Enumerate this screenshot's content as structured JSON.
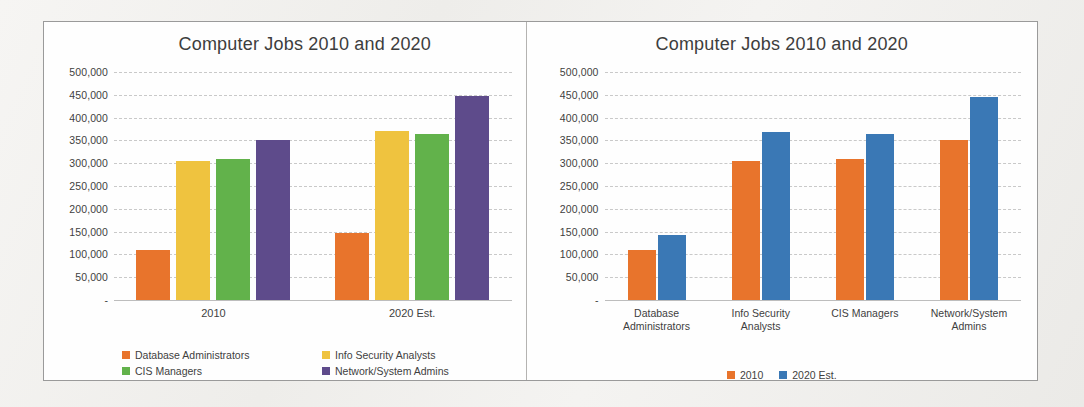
{
  "charts": [
    {
      "id": "left",
      "title": "Computer Jobs 2010 and 2020",
      "legend": [
        {
          "label": "Database Administrators",
          "color": "#E8742C"
        },
        {
          "label": "Info Security Analysts",
          "color": "#EFC githubPLACEHOLDER"
        }
      ]
    }
  ],
  "chart_data": [
    {
      "type": "bar",
      "id": "left-chart",
      "title": "Computer Jobs 2010 and 2020",
      "xlabel": "",
      "ylabel": "",
      "ylim": [
        0,
        500000
      ],
      "ytick_step": 50000,
      "grid": true,
      "legend_position": "bottom",
      "zero_tick_label": "-",
      "categories": [
        "2010",
        "2020 Est."
      ],
      "ytick_labels": [
        "500,000",
        "450,000",
        "400,000",
        "350,000",
        "300,000",
        "250,000",
        "200,000",
        "150,000",
        "100,000",
        "50,000",
        "-"
      ],
      "series": [
        {
          "name": "Database Administrators",
          "color": "#E8742C",
          "values": [
            110000,
            147000
          ]
        },
        {
          "name": "Info Security Analysts",
          "color": "#EFC33F",
          "values": [
            305000,
            370000
          ]
        },
        {
          "name": "CIS Managers",
          "color": "#62B24B",
          "values": [
            310000,
            365000
          ]
        },
        {
          "name": "Network/System Admins",
          "color": "#5E4B8B",
          "values": [
            350000,
            447000
          ]
        }
      ]
    },
    {
      "type": "bar",
      "id": "right-chart",
      "title": "Computer Jobs 2010 and 2020",
      "xlabel": "",
      "ylabel": "",
      "ylim": [
        0,
        500000
      ],
      "ytick_step": 50000,
      "grid": true,
      "legend_position": "bottom",
      "zero_tick_label": "-",
      "categories": [
        "Database Administrators",
        "Info Security Analysts",
        "CIS Managers",
        "Network/System Admins"
      ],
      "category_lines": [
        [
          "Database",
          "Administrators"
        ],
        [
          "Info Security",
          "Analysts"
        ],
        [
          "CIS Managers"
        ],
        [
          "Network/System",
          "Admins"
        ]
      ],
      "ytick_labels": [
        "500,000",
        "450,000",
        "400,000",
        "350,000",
        "300,000",
        "250,000",
        "200,000",
        "150,000",
        "100,000",
        "50,000",
        "-"
      ],
      "series": [
        {
          "name": "2010",
          "color": "#E8742C",
          "values": [
            110000,
            305000,
            310000,
            350000
          ]
        },
        {
          "name": "2020 Est.",
          "color": "#3A78B5",
          "values": [
            143000,
            368000,
            363000,
            445000
          ]
        }
      ]
    }
  ]
}
